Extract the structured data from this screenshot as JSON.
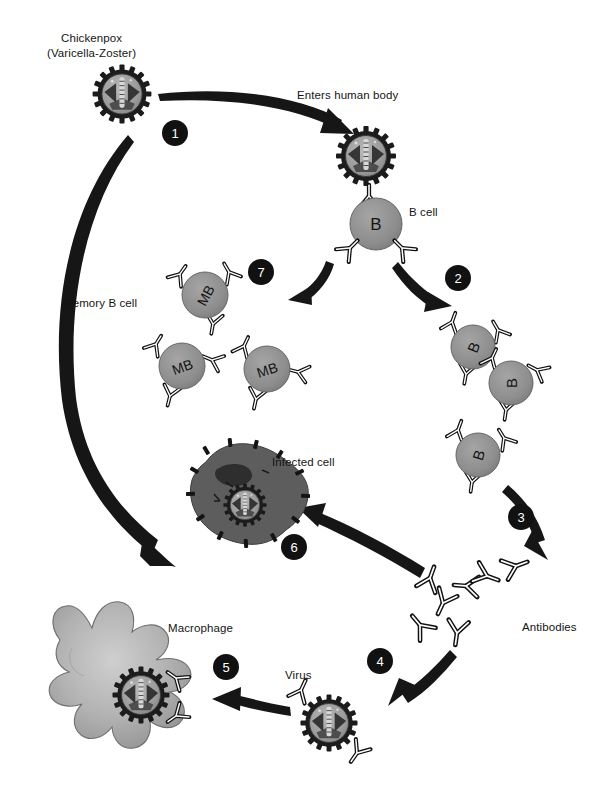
{
  "diagram": {
    "title_hidden": "",
    "background": "#ffffff",
    "badge_color": "#111111",
    "cell_fill": "#8e8e8e",
    "virus_ring": "#1c1c1c",
    "infected_fill": "#5a5a5a",
    "macrophage_fill": "#a8a8a8"
  },
  "labels": {
    "chickenpox": "Chickenpox\n(Varicella-Zoster)",
    "enters_body": "Enters human body",
    "b_cell": "B cell",
    "memory_b_cell": "Memory B cell",
    "infected_cell": "Infected cell",
    "antibodies": "Antibodies",
    "macrophage": "Macrophage",
    "virus": "Virus"
  },
  "steps": [
    {
      "n": "1",
      "x": 162,
      "y": 120,
      "meaning": "virus re-infects cells"
    },
    {
      "n": "2",
      "x": 445,
      "y": 265,
      "meaning": "B cell proliferation"
    },
    {
      "n": "3",
      "x": 508,
      "y": 504,
      "meaning": "antibody production"
    },
    {
      "n": "4",
      "x": 367,
      "y": 648,
      "meaning": "antibodies bind virus"
    },
    {
      "n": "5",
      "x": 213,
      "y": 654,
      "meaning": "macrophage engulfs virus"
    },
    {
      "n": "6",
      "x": 281,
      "y": 534,
      "meaning": "antibodies mark infected cell"
    },
    {
      "n": "7",
      "x": 248,
      "y": 259,
      "meaning": "memory B cells form"
    }
  ],
  "cells": {
    "b_cell_main": {
      "label": "B",
      "x": 376,
      "y": 224,
      "r": 26
    },
    "proliferating": [
      {
        "label": "B",
        "x": 473,
        "y": 347,
        "r": 22
      },
      {
        "label": "B",
        "x": 511,
        "y": 383,
        "r": 22
      },
      {
        "label": "B",
        "x": 478,
        "y": 455,
        "r": 22
      }
    ],
    "memory": [
      {
        "label": "MB",
        "x": 205,
        "y": 295,
        "r": 23
      },
      {
        "label": "MB",
        "x": 182,
        "y": 366,
        "r": 23
      },
      {
        "label": "MB",
        "x": 267,
        "y": 369,
        "r": 23
      }
    ]
  },
  "viruses": [
    {
      "name": "chickenpox-virus",
      "x": 122,
      "y": 94,
      "r": 25
    },
    {
      "name": "bound-virus",
      "x": 366,
      "y": 156,
      "r": 25
    },
    {
      "name": "infected-cell-virus",
      "x": 245,
      "y": 505,
      "r": 19
    },
    {
      "name": "free-virus",
      "x": 329,
      "y": 723,
      "r": 24
    },
    {
      "name": "engulfed-virus",
      "x": 141,
      "y": 695,
      "r": 24
    }
  ],
  "antibodies_cluster": [
    {
      "x": 443,
      "y": 603,
      "rot": 25
    },
    {
      "x": 420,
      "y": 625,
      "rot": 140
    },
    {
      "x": 430,
      "y": 578,
      "rot": 200
    },
    {
      "x": 465,
      "y": 586,
      "rot": 95
    },
    {
      "x": 483,
      "y": 578,
      "rot": 290
    },
    {
      "x": 512,
      "y": 568,
      "rot": 250
    },
    {
      "x": 455,
      "y": 631,
      "rot": 10
    }
  ]
}
